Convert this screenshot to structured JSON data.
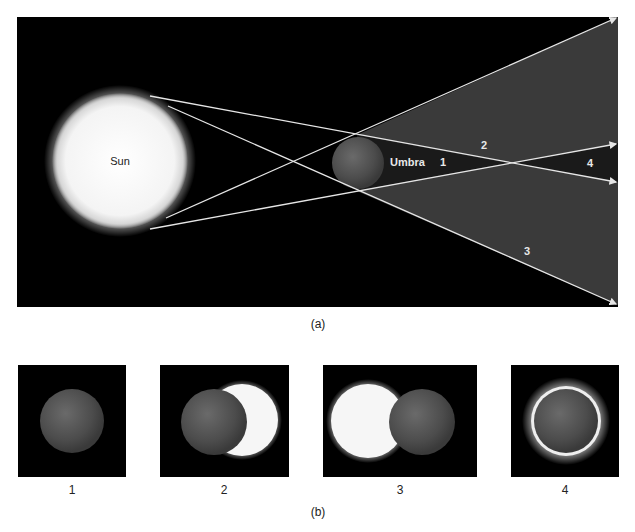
{
  "panel_a": {
    "caption": "(a)",
    "sun_label": "Sun",
    "umbra_label": "Umbra",
    "regions": [
      {
        "id": "1",
        "label": "1"
      },
      {
        "id": "2",
        "label": "2"
      },
      {
        "id": "3",
        "label": "3"
      },
      {
        "id": "4",
        "label": "4"
      }
    ],
    "colors": {
      "background": "#000000",
      "penumbra": "#3a3a3a",
      "umbra": "#1c1c1c",
      "rays": "#e6e6e6",
      "sun": "#ffffff",
      "moon": "#555555"
    }
  },
  "panel_b": {
    "caption": "(b)",
    "views": [
      {
        "label": "1",
        "description": "total eclipse (umbra)"
      },
      {
        "label": "2",
        "description": "partial eclipse, crescent right"
      },
      {
        "label": "3",
        "description": "partial eclipse, sun left"
      },
      {
        "label": "4",
        "description": "annular eclipse"
      }
    ]
  }
}
